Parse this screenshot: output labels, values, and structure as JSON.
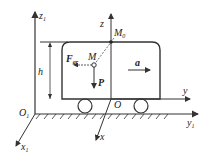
{
  "diagram": {
    "type": "mechanics-free-body",
    "labels": {
      "z1": "z",
      "z1_sub": "1",
      "z": "z",
      "M0": "M",
      "M0_sub": "0",
      "h": "h",
      "F": "F",
      "F_sub": "gr",
      "M": "M",
      "a": "a",
      "P": "P",
      "y": "y",
      "O": "O",
      "O1": "O",
      "O1_sub": "1",
      "y1": "y",
      "y1_sub": "1",
      "x": "x",
      "x1": "x",
      "x1_sub": "1"
    },
    "colors": {
      "line": "#333333",
      "background": "#ffffff"
    }
  }
}
